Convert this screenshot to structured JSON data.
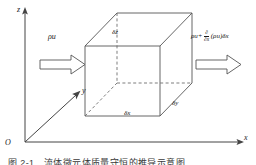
{
  "figure": {
    "type": "control-volume-diagram",
    "axes": {
      "z_label": "z",
      "x_label": "x",
      "y_label": "y",
      "origin_label": "O"
    },
    "cube": {
      "dz_label": "δz",
      "dx_label": "δx",
      "dy_label": "δy"
    },
    "flux_in": {
      "label": "ρu"
    },
    "flux_out": {
      "prefix": "ρu+",
      "numerator": "∂",
      "denominator": "∂x",
      "suffix": "(ρu)δx"
    },
    "caption": "图 2-1　流体微元体质量守恒的推导示意图",
    "colors": {
      "line": "#555555",
      "dashed": "#666666",
      "axis": "#444444",
      "text": "#1a1a1a"
    }
  }
}
